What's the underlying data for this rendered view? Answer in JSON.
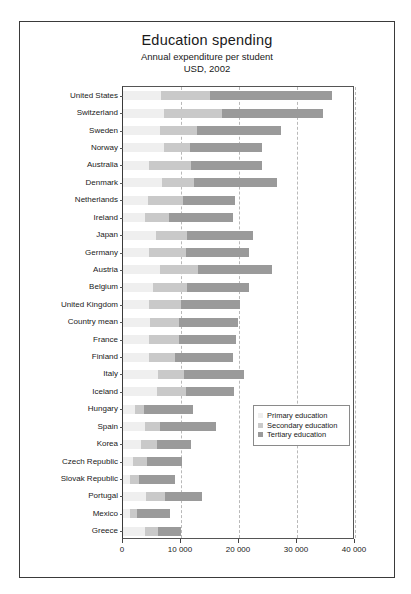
{
  "figure": {
    "title": "Education spending",
    "subtitle_1": "Annual expenditure per student",
    "subtitle_2": "USD, 2002"
  },
  "legend": {
    "items": [
      {
        "label": "Primary education",
        "color": "#efefef"
      },
      {
        "label": "Secondary education",
        "color": "#c9c9c9"
      },
      {
        "label": "Tertiary education",
        "color": "#9a9a9a"
      }
    ]
  },
  "chart_data": {
    "type": "bar",
    "orientation": "horizontal",
    "stacked": true,
    "title": "Education spending",
    "subtitle": "Annual expenditure per student USD, 2002",
    "xlabel": "",
    "ylabel": "",
    "xlim": [
      0,
      40000
    ],
    "xticks": [
      0,
      10000,
      20000,
      30000,
      40000
    ],
    "xticklabels": [
      "0",
      "10 000",
      "20 000",
      "30 000",
      "40 000"
    ],
    "grid": "vertical-dashed",
    "legend_position": "inside-right-lower",
    "categories": [
      "United States",
      "Switzerland",
      "Sweden",
      "Norway",
      "Australia",
      "Denmark",
      "Netherlands",
      "Ireland",
      "Japan",
      "Germany",
      "Austria",
      "Belgium",
      "United Kingdom",
      "Country mean",
      "France",
      "Finland",
      "Italy",
      "Iceland",
      "Hungary",
      "Spain",
      "Korea",
      "Czech Republic",
      "Slovak Republic",
      "Portugal",
      "Mexico",
      "Greece"
    ],
    "series": [
      {
        "name": "Primary education",
        "color": "#efefef",
        "values": [
          6500,
          7000,
          6300,
          7000,
          4500,
          6700,
          4300,
          3800,
          5700,
          4400,
          6300,
          5100,
          4400,
          4600,
          4500,
          4500,
          6000,
          5900,
          2100,
          3800,
          3100,
          1700,
          1200,
          4000,
          1200,
          3800
        ]
      },
      {
        "name": "Secondary education",
        "color": "#c9c9c9",
        "values": [
          8500,
          10000,
          6500,
          4500,
          7200,
          5600,
          6000,
          4200,
          5300,
          6400,
          6700,
          6000,
          5600,
          5100,
          5200,
          4400,
          4500,
          5000,
          1500,
          2500,
          2700,
          2400,
          1500,
          3200,
          1200,
          2200
        ]
      },
      {
        "name": "Tertiary education",
        "color": "#9a9a9a",
        "values": [
          21000,
          17500,
          14500,
          12500,
          12200,
          14300,
          9000,
          11000,
          11500,
          11000,
          12700,
          10700,
          10200,
          10200,
          9800,
          10100,
          10400,
          8300,
          8400,
          9800,
          6000,
          6000,
          6300,
          6500,
          5700,
          4000
        ]
      }
    ],
    "totals": [
      36000,
      34500,
      27300,
      24000,
      23900,
      26600,
      19300,
      19000,
      22500,
      21800,
      25700,
      21800,
      20200,
      19900,
      19500,
      19000,
      20900,
      19200,
      12000,
      16100,
      11800,
      10100,
      9000,
      13700,
      8100,
      10000
    ]
  }
}
